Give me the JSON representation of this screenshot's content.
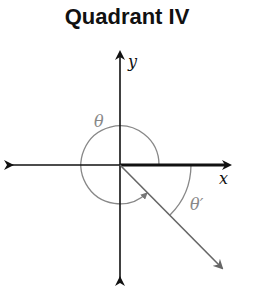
{
  "title": "Quadrant IV",
  "labels": {
    "y_axis": "y",
    "x_axis": "x",
    "theta": "θ",
    "theta_ref": "θ′"
  },
  "colors": {
    "axis": "#111111",
    "arc": "#888888",
    "terminal_ray": "#666666"
  }
}
